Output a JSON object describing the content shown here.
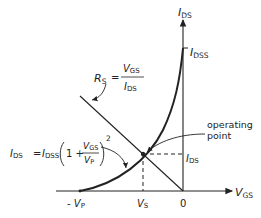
{
  "diagram": {
    "y_axis": {
      "label": "I",
      "sub": "DS"
    },
    "x_axis": {
      "label": "V",
      "sub": "GS"
    },
    "idss": {
      "label": "I",
      "sub": "DSS"
    },
    "rs_formula": {
      "lhs": "R",
      "lhs_sub": "S",
      "num": "V",
      "num_sub": "GS",
      "den": "I",
      "den_sub": "DS"
    },
    "ids_formula": {
      "lhs": "I",
      "lhs_sub": "DS",
      "eq": "=",
      "idss": "I",
      "idss_sub": "DSS",
      "one_plus": "1 +",
      "num": "V",
      "num_sub": "GS",
      "den": "V",
      "den_sub": "P",
      "power": "2"
    },
    "operating_point": {
      "line1": "operating",
      "line2": "point"
    },
    "ids_marker": {
      "label": "I",
      "sub": "DS"
    },
    "x_ticks": [
      {
        "prefix": "- ",
        "label": "V",
        "sub": "P"
      },
      {
        "prefix": "",
        "label": "V",
        "sub": "S"
      },
      {
        "prefix": "",
        "label": "0",
        "sub": ""
      }
    ]
  }
}
